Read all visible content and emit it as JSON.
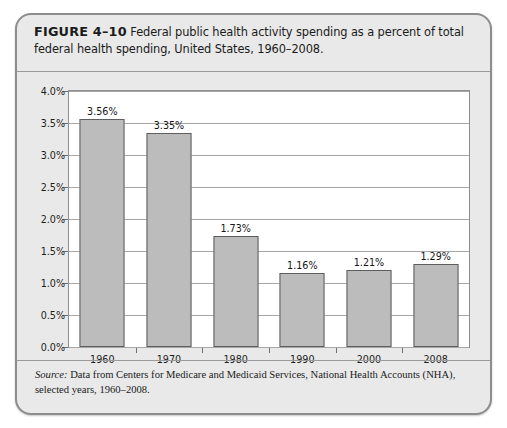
{
  "figure": {
    "label": "FIGURE 4–10",
    "caption": "Federal public health activity spending as a percent of total federal health spending, United States, 1960–2008.",
    "source_word": "Source:",
    "source_text": " Data from Centers for Medicare and Medicaid Services, National Health Accounts (NHA), selected years, 1960–2008."
  },
  "colors": {
    "panel_background": "#e9e9e9",
    "panel_border": "#8d8d8d",
    "plot_background": "#ffffff",
    "bar_fill": "#bcbcbc",
    "bar_border": "#5e5e5e",
    "gridline": "#a7a7a7",
    "text": "#1b1b1b"
  },
  "chart_data": {
    "type": "bar",
    "title": "Federal public health activity spending as a percent of total federal health spending, United States, 1960–2008.",
    "xlabel": "",
    "ylabel": "",
    "categories": [
      "1960",
      "1970",
      "1980",
      "1990",
      "2000",
      "2008"
    ],
    "values": [
      3.56,
      3.35,
      1.73,
      1.16,
      1.21,
      1.29
    ],
    "value_labels": [
      "3.56%",
      "3.35%",
      "1.73%",
      "1.16%",
      "1.21%",
      "1.29%"
    ],
    "ylim": [
      0.0,
      4.0
    ],
    "ytick_values": [
      0.0,
      0.5,
      1.0,
      1.5,
      2.0,
      2.5,
      3.0,
      3.5,
      4.0
    ],
    "ytick_labels": [
      "0.0%",
      "0.5%",
      "1.0%",
      "1.5%",
      "2.0%",
      "2.5%",
      "3.0%",
      "3.5%",
      "4.0%"
    ],
    "grid": true,
    "grid_axis": "y",
    "legend": false,
    "legend_position": "none"
  }
}
